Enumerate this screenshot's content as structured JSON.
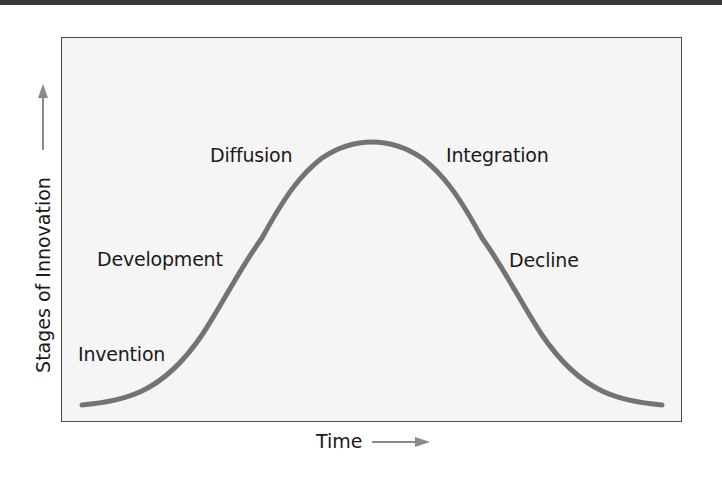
{
  "diagram": {
    "title": "",
    "x_axis_label": "Time",
    "y_axis_label": "Stages of Innovation",
    "stages": [
      {
        "label": "Invention"
      },
      {
        "label": "Development"
      },
      {
        "label": "Diffusion"
      },
      {
        "label": "Integration"
      },
      {
        "label": "Decline"
      }
    ],
    "curve": {
      "shape": "bell",
      "color": "#737373",
      "stroke_width": 5
    },
    "colors": {
      "background": "#f5f5f5",
      "border": "#4a4a4a",
      "arrow": "#8a8a8a",
      "text": "#1a1a1a"
    }
  }
}
